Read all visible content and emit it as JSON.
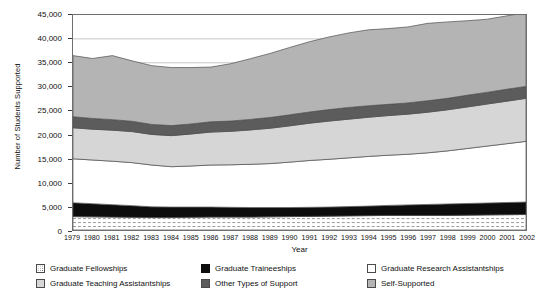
{
  "chart_data": {
    "type": "area",
    "stacked": true,
    "title": "",
    "xlabel": "Year",
    "ylabel": "Number of Students Supported",
    "x": [
      1979,
      1980,
      1981,
      1982,
      1983,
      1984,
      1985,
      1986,
      1987,
      1988,
      1989,
      1990,
      1991,
      1992,
      1993,
      1994,
      1995,
      1996,
      1997,
      1998,
      1999,
      2000,
      2001,
      2002
    ],
    "categories": [
      "1979",
      "1980",
      "1981",
      "1982",
      "1983",
      "1984",
      "1985",
      "1986",
      "1987",
      "1988",
      "1989",
      "1990",
      "1991",
      "1992",
      "1993",
      "1994",
      "1995",
      "1996",
      "1997",
      "1998",
      "1999",
      "2000",
      "2001",
      "2002"
    ],
    "ylim": [
      0,
      45000
    ],
    "ytick_labels": [
      "0",
      "5,000",
      "10,000",
      "15,000",
      "20,000",
      "25,000",
      "30,000",
      "35,000",
      "40,000",
      "45,000"
    ],
    "ytick_values": [
      0,
      5000,
      10000,
      15000,
      20000,
      25000,
      30000,
      35000,
      40000,
      45000
    ],
    "ytick_interval": 5000,
    "grid": "horizontal",
    "legend_position": "bottom",
    "series": [
      {
        "name": "Graduate Fellowships",
        "fill": "#ffffff",
        "pattern": "dots",
        "values": [
          2800,
          2750,
          2700,
          2650,
          2600,
          2600,
          2650,
          2700,
          2700,
          2700,
          2750,
          2800,
          2850,
          2900,
          2950,
          3000,
          3050,
          3050,
          3050,
          3050,
          3100,
          3150,
          3200,
          3250
        ]
      },
      {
        "name": "Graduate Traineeships",
        "fill": "#0d0d0d",
        "pattern": "solid",
        "values": [
          2900,
          2750,
          2600,
          2450,
          2250,
          2200,
          2150,
          2100,
          2050,
          2000,
          1950,
          1900,
          1900,
          1900,
          1950,
          2000,
          2100,
          2200,
          2300,
          2400,
          2450,
          2500,
          2550,
          2600
        ]
      },
      {
        "name": "Graduate Research Assistantships",
        "fill": "#ffffff",
        "pattern": "solid",
        "values": [
          9200,
          9150,
          9100,
          9000,
          8750,
          8450,
          8600,
          8800,
          8900,
          9050,
          9200,
          9500,
          9800,
          10000,
          10200,
          10400,
          10500,
          10600,
          10800,
          11100,
          11500,
          11900,
          12300,
          12700
        ]
      },
      {
        "name": "Graduate Teaching Assistantships",
        "fill": "#d6d6d6",
        "pattern": "solid",
        "values": [
          6500,
          6450,
          6500,
          6500,
          6400,
          6500,
          6700,
          6900,
          7000,
          7200,
          7400,
          7600,
          7800,
          8000,
          8100,
          8200,
          8300,
          8400,
          8500,
          8600,
          8700,
          8800,
          8900,
          9000
        ]
      },
      {
        "name": "Other Types of Support",
        "fill": "#5c5c5c",
        "pattern": "solid",
        "values": [
          2300,
          2250,
          2200,
          2150,
          2100,
          2100,
          2100,
          2150,
          2150,
          2200,
          2250,
          2300,
          2350,
          2400,
          2450,
          2400,
          2350,
          2350,
          2400,
          2400,
          2450,
          2450,
          2500,
          2500
        ]
      },
      {
        "name": "Self-Supported",
        "fill": "#b4b4b4",
        "pattern": "solid",
        "values": [
          12800,
          12550,
          13400,
          12650,
          12300,
          12150,
          11800,
          11450,
          12000,
          12700,
          13400,
          14100,
          14700,
          15200,
          15600,
          15900,
          15850,
          15900,
          16200,
          16000,
          15600,
          15300,
          15350,
          15450
        ]
      }
    ],
    "totals": [
      36500,
      35900,
      36500,
      35400,
      34400,
      34000,
      34000,
      34100,
      34800,
      35850,
      36950,
      38200,
      39400,
      40400,
      41250,
      41900,
      42150,
      42500,
      43250,
      43550,
      43800,
      44100,
      44800,
      45500
    ]
  },
  "axes": {
    "y_title": "Number of Students Supported",
    "x_title": "Year"
  },
  "legend": {
    "column1": [
      {
        "label": "Graduate Fellowships",
        "swatch": "sw-fellow"
      },
      {
        "label": "Graduate Teaching Assistantships",
        "swatch": "sw-ta"
      }
    ],
    "column2": [
      {
        "label": "Graduate Traineeships",
        "swatch": "sw-train"
      },
      {
        "label": "Other Types of Support",
        "swatch": "sw-other"
      }
    ],
    "column3": [
      {
        "label": "Graduate Research Assistantships",
        "swatch": "sw-ra"
      },
      {
        "label": "Self-Supported",
        "swatch": "sw-self"
      }
    ]
  }
}
